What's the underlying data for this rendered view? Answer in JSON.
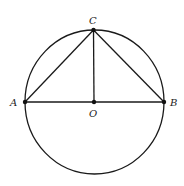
{
  "diagram": {
    "circle": {
      "cx": 94.5,
      "cy": 102,
      "rx": 69.5,
      "ry": 72
    },
    "points": {
      "A": {
        "label": "A",
        "x": 25,
        "y": 102
      },
      "B": {
        "label": "B",
        "x": 164,
        "y": 102
      },
      "C": {
        "label": "C",
        "x": 93.5,
        "y": 30
      },
      "O": {
        "label": "O",
        "x": 94,
        "y": 102
      }
    },
    "segments": [
      "AB",
      "AC",
      "BC",
      "CO"
    ],
    "stroke_color": "#1a1a1a"
  }
}
